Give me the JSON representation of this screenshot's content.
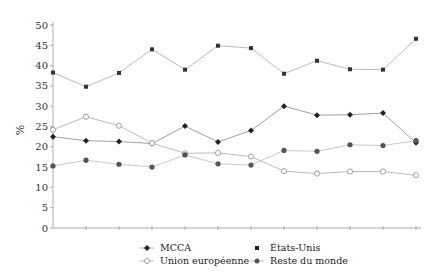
{
  "chart_data": {
    "type": "line",
    "title": "",
    "xlabel": "",
    "ylabel": "%",
    "ylim": [
      0,
      50
    ],
    "yticks": [
      0,
      5,
      10,
      15,
      20,
      25,
      30,
      35,
      40,
      45,
      50
    ],
    "x": [
      1,
      2,
      3,
      4,
      5,
      6,
      7,
      8,
      9,
      10,
      11,
      12
    ],
    "grid": false,
    "legend_position": "bottom",
    "series": [
      {
        "name": "MCCA",
        "marker": "diamond-filled",
        "values": [
          22.5,
          21.5,
          21.3,
          20.8,
          25.1,
          21.2,
          24.0,
          30.0,
          27.8,
          27.9,
          28.3,
          21.0
        ]
      },
      {
        "name": "États-Unis",
        "marker": "square-filled",
        "values": [
          38.3,
          34.8,
          38.2,
          44.0,
          39.0,
          44.9,
          44.3,
          38.0,
          41.2,
          39.1,
          39.0,
          46.6
        ]
      },
      {
        "name": "Union européenne",
        "marker": "circle-open",
        "values": [
          24.2,
          27.4,
          25.2,
          20.9,
          18.4,
          18.5,
          17.6,
          14.0,
          13.4,
          13.9,
          13.9,
          13.0
        ]
      },
      {
        "name": "Reste du monde",
        "marker": "circle-filled",
        "values": [
          15.3,
          16.7,
          15.7,
          15.0,
          18.0,
          15.8,
          15.5,
          19.1,
          18.9,
          20.5,
          20.3,
          21.5
        ]
      }
    ]
  },
  "legend": {
    "items": [
      "MCCA",
      "États-Unis",
      "Union européenne",
      "Reste du monde"
    ]
  },
  "axis": {
    "ylabel": "%"
  }
}
